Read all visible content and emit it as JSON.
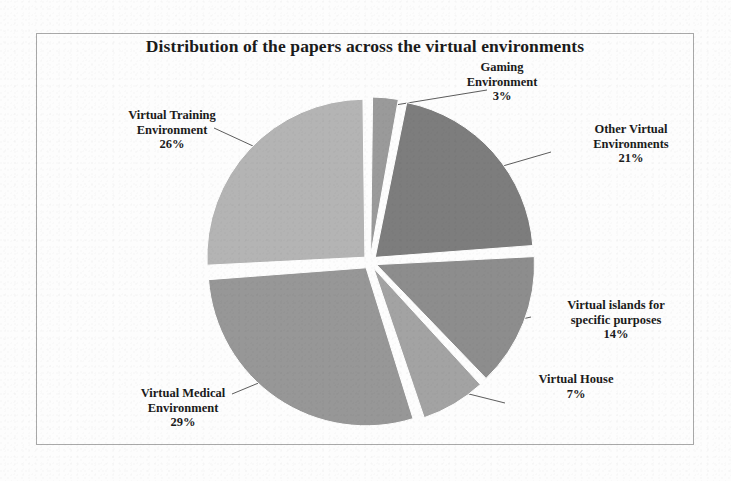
{
  "figure": {
    "title": "Distribution of the papers across the virtual environments",
    "frame_color": "#a9a9a9",
    "background_color": "#fdfdfd"
  },
  "chart_data": {
    "type": "pie",
    "title": "Distribution of the papers across the virtual environments",
    "xlabel": "",
    "ylabel": "",
    "grid": false,
    "legend": "none",
    "labels_position": "outside-with-leader-lines",
    "exploded": true,
    "value_unit": "percent",
    "categories": [
      "Gaming Environment",
      "Other Virtual Environments",
      "Virtual islands for specific purposes",
      "Virtual House",
      "Virtual Medical Environment",
      "Virtual Training Environment"
    ],
    "values": [
      3,
      21,
      14,
      7,
      29,
      26
    ],
    "colors": [
      "#9a9a9a",
      "#7d7d7d",
      "#8d8d8d",
      "#a3a3a3",
      "#979797",
      "#b4b4b4"
    ],
    "slices": [
      {
        "name": "Gaming Environment",
        "label_line1": "Gaming",
        "label_line2": "Environment",
        "value": 3,
        "percent_text": "3%",
        "color": "#9a9a9a",
        "start_angle": 0,
        "end_angle": 10.8
      },
      {
        "name": "Other Virtual Environments",
        "label_line1": "Other Virtual",
        "label_line2": "Environments",
        "value": 21,
        "percent_text": "21%",
        "color": "#7d7d7d",
        "start_angle": 10.8,
        "end_angle": 86.4
      },
      {
        "name": "Virtual islands for specific purposes",
        "label_line1": "Virtual islands for",
        "label_line2": "specific purposes",
        "value": 14,
        "percent_text": "14%",
        "color": "#8d8d8d",
        "start_angle": 86.4,
        "end_angle": 136.8
      },
      {
        "name": "Virtual House",
        "label_line1": "Virtual House",
        "label_line2": "",
        "value": 7,
        "percent_text": "7%",
        "color": "#a3a3a3",
        "start_angle": 136.8,
        "end_angle": 162.0
      },
      {
        "name": "Virtual Medical Environment",
        "label_line1": "Virtual Medical",
        "label_line2": "Environment",
        "value": 29,
        "percent_text": "29%",
        "color": "#979797",
        "start_angle": 162.0,
        "end_angle": 266.4
      },
      {
        "name": "Virtual Training Environment",
        "label_line1": "Virtual Training",
        "label_line2": "Environment",
        "value": 26,
        "percent_text": "26%",
        "color": "#b4b4b4",
        "start_angle": 266.4,
        "end_angle": 360.0
      }
    ]
  }
}
